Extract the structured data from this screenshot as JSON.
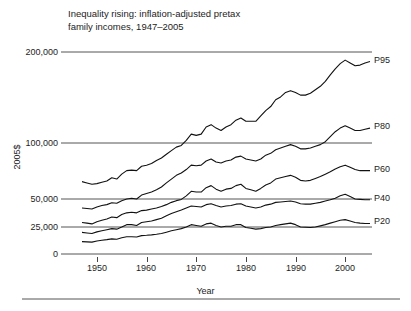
{
  "chart_data": {
    "type": "line",
    "title": "Inequality rising: inflation-adjusted pretax\nfamily incomes, 1947–2005",
    "xlabel": "Year",
    "ylabel": "2005$",
    "grid": true,
    "yscale": "log-like",
    "xlim": [
      1947,
      2005
    ],
    "ylim": [
      0,
      200000
    ],
    "xticks": [
      1950,
      1960,
      1970,
      1980,
      1990,
      2000
    ],
    "xtick_labels": [
      "1950",
      "1960",
      "1970",
      "1980",
      "1990",
      "2000"
    ],
    "yticks": [
      0,
      25000,
      50000,
      100000,
      200000
    ],
    "ytick_labels": [
      "0",
      "25,000",
      "50,000",
      "100,000",
      "200,000"
    ],
    "legend_position": "right-inline",
    "series": [
      {
        "name": "P95",
        "label": "P95",
        "x": [
          1947,
          1948,
          1949,
          1950,
          1951,
          1952,
          1953,
          1954,
          1955,
          1956,
          1957,
          1958,
          1959,
          1960,
          1961,
          1962,
          1963,
          1964,
          1965,
          1966,
          1967,
          1968,
          1969,
          1970,
          1971,
          1972,
          1973,
          1974,
          1975,
          1976,
          1977,
          1978,
          1979,
          1980,
          1981,
          1982,
          1983,
          1984,
          1985,
          1986,
          1987,
          1988,
          1989,
          1990,
          1991,
          1992,
          1993,
          1994,
          1995,
          1996,
          1997,
          1998,
          1999,
          2000,
          2001,
          2002,
          2003,
          2004,
          2005
        ],
        "values": [
          62000,
          61000,
          60000,
          60500,
          61500,
          62500,
          65000,
          64000,
          68000,
          71000,
          71500,
          71000,
          75000,
          76000,
          77500,
          80500,
          83000,
          87000,
          91000,
          95000,
          97000,
          102000,
          107000,
          106000,
          107000,
          113000,
          115000,
          112000,
          110000,
          113000,
          115000,
          119000,
          121000,
          118000,
          118000,
          118000,
          123000,
          128000,
          132000,
          139000,
          142000,
          147000,
          149000,
          147000,
          144000,
          144000,
          146000,
          150000,
          154000,
          160000,
          168000,
          176000,
          183000,
          188000,
          184000,
          180000,
          181000,
          184000,
          186000
        ]
      },
      {
        "name": "P80",
        "label": "P80",
        "x": [
          1947,
          1948,
          1949,
          1950,
          1951,
          1952,
          1953,
          1954,
          1955,
          1956,
          1957,
          1958,
          1959,
          1960,
          1961,
          1962,
          1963,
          1964,
          1965,
          1966,
          1967,
          1968,
          1969,
          1970,
          1971,
          1972,
          1973,
          1974,
          1975,
          1976,
          1977,
          1978,
          1979,
          1980,
          1981,
          1982,
          1983,
          1984,
          1985,
          1986,
          1987,
          1988,
          1989,
          1990,
          1991,
          1992,
          1993,
          1994,
          1995,
          1996,
          1997,
          1998,
          1999,
          2000,
          2001,
          2002,
          2003,
          2004,
          2005
        ],
        "values": [
          40000,
          39500,
          39000,
          41000,
          42500,
          43500,
          45500,
          45000,
          48000,
          50000,
          50500,
          50000,
          52500,
          53500,
          54500,
          56000,
          58000,
          61000,
          64000,
          67000,
          69000,
          72000,
          76000,
          75500,
          76000,
          80000,
          82000,
          79000,
          78000,
          80000,
          81000,
          84000,
          85000,
          82000,
          81000,
          80000,
          82000,
          86000,
          88000,
          92000,
          94000,
          96000,
          98000,
          96000,
          93000,
          93000,
          94000,
          96000,
          98000,
          101000,
          105000,
          109000,
          112000,
          114000,
          112000,
          110000,
          110000,
          111000,
          112000
        ]
      },
      {
        "name": "P60",
        "label": "P60",
        "x": [
          1947,
          1948,
          1949,
          1950,
          1951,
          1952,
          1953,
          1954,
          1955,
          1956,
          1957,
          1958,
          1959,
          1960,
          1961,
          1962,
          1963,
          1964,
          1965,
          1966,
          1967,
          1968,
          1969,
          1970,
          1971,
          1972,
          1973,
          1974,
          1975,
          1976,
          1977,
          1978,
          1979,
          1980,
          1981,
          1982,
          1983,
          1984,
          1985,
          1986,
          1987,
          1988,
          1989,
          1990,
          1991,
          1992,
          1993,
          1994,
          1995,
          1996,
          1997,
          1998,
          1999,
          2000,
          2001,
          2002,
          2003,
          2004,
          2005
        ],
        "values": [
          28000,
          27500,
          27000,
          28500,
          29500,
          30500,
          32000,
          31500,
          34000,
          35500,
          36000,
          35500,
          37500,
          38000,
          39000,
          40000,
          41500,
          43500,
          46000,
          48000,
          49500,
          52000,
          55000,
          54500,
          54500,
          57500,
          59000,
          56500,
          55000,
          56500,
          57000,
          59000,
          60000,
          57000,
          56000,
          55000,
          57000,
          59500,
          61000,
          64000,
          65000,
          66000,
          67000,
          65500,
          63000,
          62500,
          63000,
          64500,
          66000,
          68000,
          70000,
          72500,
          74500,
          76000,
          74000,
          72000,
          71000,
          71000,
          71000
        ]
      },
      {
        "name": "P40",
        "label": "P40",
        "x": [
          1947,
          1948,
          1949,
          1950,
          1951,
          1952,
          1953,
          1954,
          1955,
          1956,
          1957,
          1958,
          1959,
          1960,
          1961,
          1962,
          1963,
          1964,
          1965,
          1966,
          1967,
          1968,
          1969,
          1970,
          1971,
          1972,
          1973,
          1974,
          1975,
          1976,
          1977,
          1978,
          1979,
          1980,
          1981,
          1982,
          1983,
          1984,
          1985,
          1986,
          1987,
          1988,
          1989,
          1990,
          1991,
          1992,
          1993,
          1994,
          1995,
          1996,
          1997,
          1998,
          1999,
          2000,
          2001,
          2002,
          2003,
          2004,
          2005
        ],
        "values": [
          20000,
          19500,
          19000,
          20500,
          21500,
          22500,
          23500,
          23000,
          25000,
          26500,
          26500,
          26000,
          28000,
          28500,
          29000,
          30000,
          31000,
          33000,
          35000,
          36500,
          38000,
          40000,
          42000,
          41500,
          41000,
          43500,
          44500,
          42500,
          41000,
          42000,
          42500,
          44000,
          44500,
          42000,
          41000,
          40000,
          41000,
          43000,
          44000,
          46000,
          46500,
          47000,
          47500,
          46500,
          44500,
          44000,
          44000,
          45000,
          46000,
          47500,
          49000,
          50500,
          52000,
          53000,
          51500,
          50000,
          49500,
          49000,
          49000
        ]
      },
      {
        "name": "P20",
        "label": "P20",
        "x": [
          1947,
          1948,
          1949,
          1950,
          1951,
          1952,
          1953,
          1954,
          1955,
          1956,
          1957,
          1958,
          1959,
          1960,
          1961,
          1962,
          1963,
          1964,
          1965,
          1966,
          1967,
          1968,
          1969,
          1970,
          1971,
          1972,
          1973,
          1974,
          1975,
          1976,
          1977,
          1978,
          1979,
          1980,
          1981,
          1982,
          1983,
          1984,
          1985,
          1986,
          1987,
          1988,
          1989,
          1990,
          1991,
          1992,
          1993,
          1994,
          1995,
          1996,
          1997,
          1998,
          1999,
          2000,
          2001,
          2002,
          2003,
          2004,
          2005
        ],
        "values": [
          11500,
          11200,
          11000,
          12000,
          12700,
          13300,
          14000,
          13700,
          15000,
          16000,
          16000,
          15700,
          17000,
          17300,
          17700,
          18300,
          19000,
          20200,
          21500,
          22500,
          23500,
          25000,
          26500,
          26000,
          25500,
          27000,
          27500,
          26000,
          25000,
          25500,
          25500,
          26500,
          26500,
          24500,
          23800,
          23000,
          23500,
          24500,
          25000,
          26000,
          26500,
          27000,
          27500,
          26500,
          25000,
          24700,
          24500,
          25000,
          25700,
          26500,
          27500,
          28500,
          29500,
          30000,
          29000,
          28000,
          27500,
          27300,
          27300
        ]
      }
    ]
  },
  "footer": {
    "rule": true
  }
}
